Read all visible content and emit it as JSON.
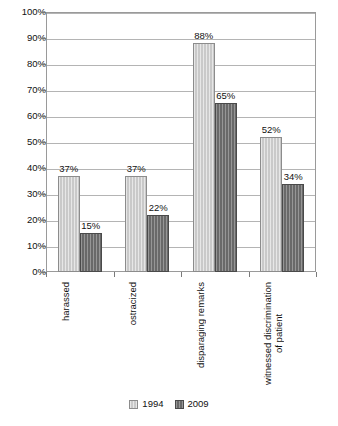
{
  "chart_data": {
    "type": "bar",
    "title": "",
    "subtitle": "",
    "xlabel": "",
    "ylabel": "",
    "ylim": [
      0,
      100
    ],
    "y_unit": "%",
    "grid": true,
    "legend_position": "bottom-center",
    "categories": [
      "harassed",
      "ostracized",
      "disparaging remarks",
      "witnessed discrimination\nof patient"
    ],
    "category_labels_rotated": true,
    "y_ticks": [
      "0%",
      "10%",
      "20%",
      "30%",
      "40%",
      "50%",
      "60%",
      "70%",
      "80%",
      "90%",
      "100%"
    ],
    "y_tick_values": [
      0,
      10,
      20,
      30,
      40,
      50,
      60,
      70,
      80,
      90,
      100
    ],
    "series": [
      {
        "name": "1994",
        "color": "#c9c9c9",
        "values": [
          37,
          37,
          88,
          52
        ],
        "labels": [
          "37%",
          "37%",
          "88%",
          "52%"
        ]
      },
      {
        "name": "2009",
        "color": "#696969",
        "values": [
          15,
          22,
          65,
          34
        ],
        "labels": [
          "15%",
          "22%",
          "65%",
          "34%"
        ]
      }
    ]
  },
  "legend": {
    "items": [
      {
        "label": "1994",
        "series": "s1994"
      },
      {
        "label": "2009",
        "series": "s2009"
      }
    ]
  }
}
